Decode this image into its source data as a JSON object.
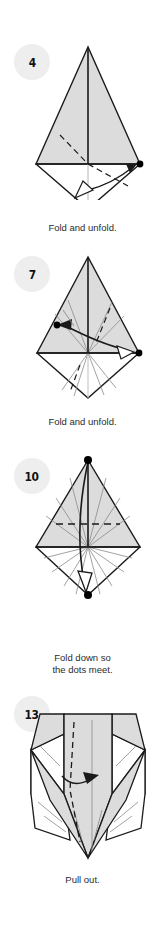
{
  "page": {
    "background": "#ffffff",
    "width": 165,
    "height": 926,
    "kind": "origami-instruction-column"
  },
  "style": {
    "paper_front": "#dcdcdc",
    "paper_back": "#ffffff",
    "outline": "#1a1a1a",
    "crease": "#8a8a8a",
    "badge_bg": "#eeeeee",
    "text": "#2b2b2b",
    "dot": "#000000"
  },
  "steps": [
    {
      "number": "4",
      "caption_lines": [
        "Fold and unfold."
      ],
      "caption": "Fold and unfold.",
      "diagram": "kite-with-valley-fold-and-hollow-arrow",
      "dots": 2
    },
    {
      "number": "7",
      "caption_lines": [
        "Fold and unfold."
      ],
      "caption": "Fold and unfold.",
      "diagram": "kite-with-fan-creases-and-curved-double-arrow",
      "dots": 2
    },
    {
      "number": "10",
      "caption_lines": [
        "Fold down so",
        "the dots meet."
      ],
      "caption": "Fold down so the dots meet.",
      "diagram": "kite-with-radiating-creases-and-long-down-arrow",
      "dots": 2
    },
    {
      "number": "13",
      "caption_lines": [
        "Pull out."
      ],
      "caption": "Pull out.",
      "diagram": "shield-form-with-pull-out-arrow",
      "dots": 0
    }
  ]
}
